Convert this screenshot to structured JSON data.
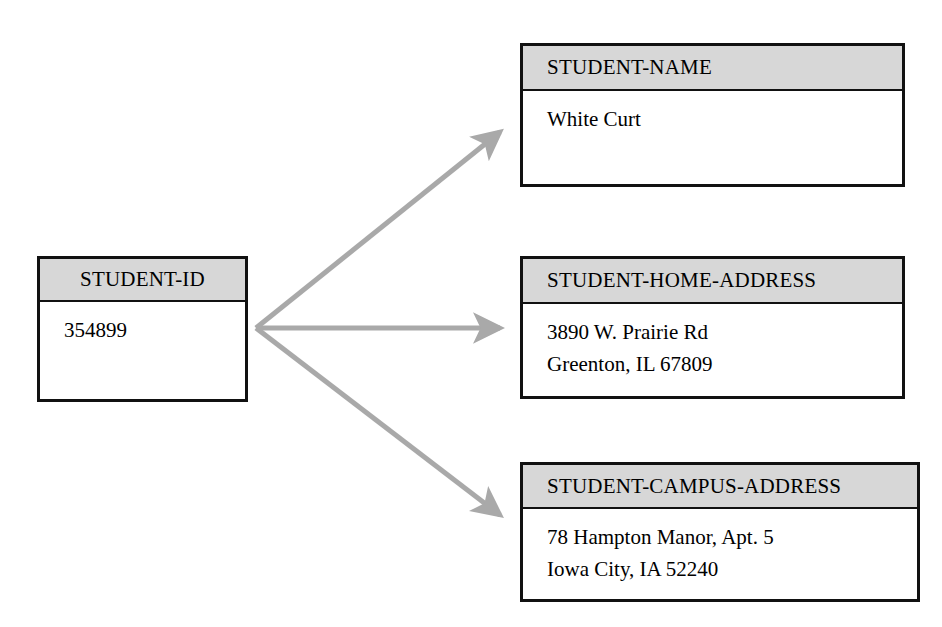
{
  "diagram": {
    "arrow_color": "#a9a9a9",
    "header_fill": "#d7d7d7",
    "border_color": "#111111",
    "background": "#ffffff"
  },
  "source_entity": {
    "header": "STUDENT-ID",
    "values": [
      "354899"
    ]
  },
  "target_entities": [
    {
      "header": "STUDENT-NAME",
      "values": [
        "White Curt"
      ]
    },
    {
      "header": "STUDENT-HOME-ADDRESS",
      "values": [
        "3890 W. Prairie Rd",
        "Greenton, IL 67809"
      ]
    },
    {
      "header": "STUDENT-CAMPUS-ADDRESS",
      "values": [
        "78 Hampton Manor, Apt. 5",
        "Iowa City, IA 52240"
      ]
    }
  ],
  "arrows": [
    {
      "name": "arrow-to-student-name",
      "from": [
        256,
        328
      ],
      "to": [
        508,
        126
      ]
    },
    {
      "name": "arrow-to-home-address",
      "from": [
        256,
        328
      ],
      "to": [
        508,
        328
      ]
    },
    {
      "name": "arrow-to-campus-address",
      "from": [
        256,
        328
      ],
      "to": [
        508,
        521
      ]
    }
  ]
}
